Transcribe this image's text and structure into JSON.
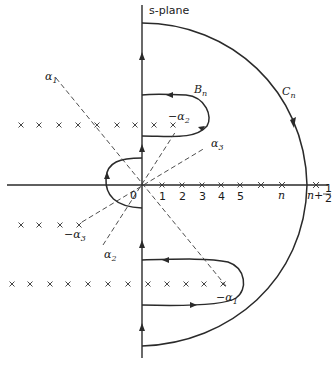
{
  "title": "s-plane",
  "labels": {
    "plane": "s-plane",
    "contour_B": "B",
    "contour_B_sub": "n",
    "contour_C": "C",
    "contour_C_sub": "n",
    "origin": "0",
    "alpha1": "α",
    "alpha1_sub": "1",
    "alpha2": "α",
    "alpha2_sub": "2",
    "alpha3": "α",
    "alpha3_sub": "3",
    "neg_alpha1": "−α",
    "neg_alpha1_sub": "1",
    "neg_alpha2": "−α",
    "neg_alpha2_sub": "2",
    "neg_alpha3": "−α",
    "neg_alpha3_sub": "3",
    "n": "n",
    "n_half_prefix": "n+",
    "n_half_num": "1",
    "n_half_den": "2"
  },
  "real_axis_ticks": [
    {
      "label": "1",
      "x": 162
    },
    {
      "label": "2",
      "x": 182
    },
    {
      "label": "3",
      "x": 202
    },
    {
      "label": "4",
      "x": 221
    },
    {
      "label": "5",
      "x": 240
    }
  ],
  "pole_rows": {
    "upper": {
      "y": 125,
      "x": [
        21,
        39,
        59,
        78,
        97,
        117,
        135,
        154,
        173
      ]
    },
    "middle": {
      "y": 225,
      "x": [
        21,
        39,
        60,
        79
      ]
    },
    "lower": {
      "y": 284,
      "x": [
        12,
        30,
        50,
        68,
        88,
        108,
        128,
        148,
        167,
        186,
        204,
        223
      ]
    }
  },
  "colors": {
    "ink": "#2a2a2a",
    "background": "#ffffff"
  }
}
